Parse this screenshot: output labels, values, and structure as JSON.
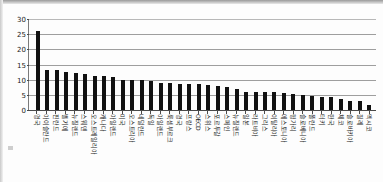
{
  "figure": {
    "name": "oecd-country-bar-chart",
    "axis_color": "#1a1a1a",
    "bar_color": "#111111",
    "grid_color": "#9e9e9e"
  },
  "chart_data": {
    "type": "bar",
    "title": "",
    "subtitle": "",
    "xlabel": "",
    "ylabel": "",
    "ylim": [
      0,
      30
    ],
    "yticks": [
      0,
      5,
      10,
      15,
      20,
      25,
      30
    ],
    "grid": true,
    "legend": false,
    "legend_position": "none",
    "orientation": "vertical",
    "categories": [
      "영국",
      "아이슬란드",
      "핀란드",
      "벨기에",
      "뉴질랜드",
      "스웨덴",
      "오스트레일리아",
      "캐나다",
      "아일랜드",
      "미국",
      "오스트리아",
      "네덜란드",
      "독일",
      "아일랜드",
      "룩셈부르크",
      "영국",
      "프랑스",
      "OECD",
      "스위스",
      "포르투갈",
      "스페인",
      "뉴질랜드",
      "일본",
      "라트비아",
      "그리스",
      "이탈리아",
      "에스토니아",
      "헝가리",
      "슬로베니아",
      "폴란드",
      "터키",
      "한국",
      "체코",
      "슬로바키아",
      "칠레",
      "멕시코"
    ],
    "values": [
      26.5,
      13.6,
      13.4,
      12.9,
      12.5,
      12.2,
      11.5,
      11.4,
      11.3,
      10.2,
      10.2,
      10.1,
      9.8,
      9.4,
      9.1,
      9.0,
      8.9,
      8.8,
      8.7,
      8.1,
      8.0,
      7.4,
      6.4,
      6.2,
      6.2,
      6.2,
      6.0,
      5.6,
      5.3,
      4.9,
      4.6,
      4.5,
      4.1,
      3.4,
      3.3,
      2.1
    ]
  }
}
